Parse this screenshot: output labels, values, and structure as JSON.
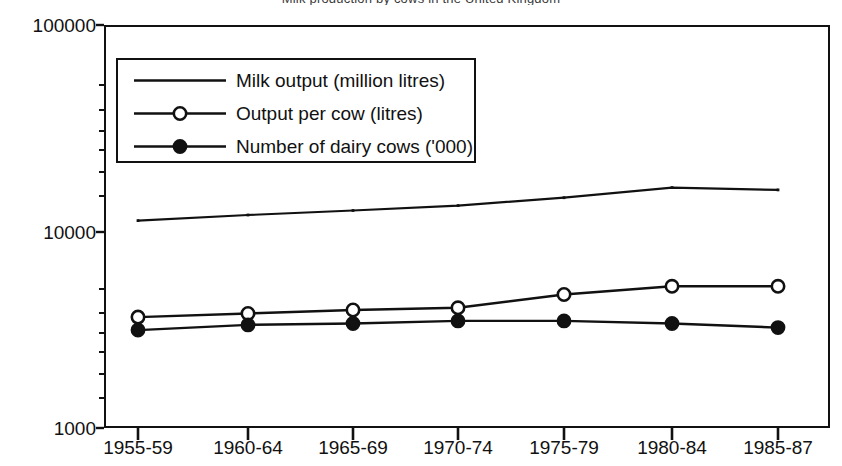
{
  "figure": {
    "title_clipped": "Milk production by cows in the United Kingdom",
    "background": "#ffffff",
    "ink_color": "#111111"
  },
  "chart_data": {
    "type": "line",
    "title": "",
    "xlabel": "",
    "ylabel": "",
    "scale": "log",
    "ylim": [
      1000,
      100000
    ],
    "y_ticks": [
      "1000",
      "10000",
      "100000"
    ],
    "y_tick_values": [
      1000,
      10000,
      100000
    ],
    "minor_ticks": true,
    "grid": false,
    "legend_position": "upper-left-inside",
    "categories": [
      "1955-59",
      "1960-64",
      "1965-69",
      "1970-74",
      "1975-79",
      "1980-84",
      "1985-87"
    ],
    "series": [
      {
        "name": "Milk output (million litres)",
        "marker": "none",
        "marker_style": "line-only",
        "values": [
          10700,
          11400,
          12000,
          12700,
          13900,
          15600,
          15200
        ]
      },
      {
        "name": "Output per cow (litres)",
        "marker": "open-circle",
        "marker_style": "hollow",
        "values": [
          3550,
          3700,
          3850,
          3950,
          4600,
          5050,
          5050
        ]
      },
      {
        "name": "Number of dairy cows ('000)",
        "marker": "filled-circle",
        "marker_style": "solid",
        "values": [
          3060,
          3250,
          3300,
          3400,
          3400,
          3300,
          3150
        ]
      }
    ]
  },
  "legend": {
    "entries": [
      {
        "label": "Milk output (million litres)",
        "marker": "none"
      },
      {
        "label": "Output per cow (litres)",
        "marker": "open-circle"
      },
      {
        "label": "Number of dairy cows ('000)",
        "marker": "filled-circle"
      }
    ]
  },
  "axes": {
    "y_labels": [
      "100000",
      "10000",
      "1000"
    ],
    "x_labels": [
      "1955-59",
      "1960-64",
      "1965-69",
      "1970-74",
      "1975-79",
      "1980-84",
      "1985-87"
    ]
  }
}
